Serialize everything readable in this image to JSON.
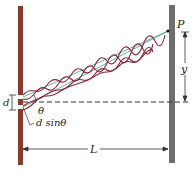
{
  "diagram": {
    "labels": {
      "point": "P",
      "y": "y",
      "d": "d",
      "theta": "θ",
      "path_difference": "d sinθ",
      "distance": "L"
    },
    "colors": {
      "barrier": "#8b3a2e",
      "screen": "#6e6e6e",
      "wave": "#8a2a3e",
      "ray": "#4a9a8a",
      "dashed_axis": "#333333",
      "arrow": "#333333"
    }
  }
}
